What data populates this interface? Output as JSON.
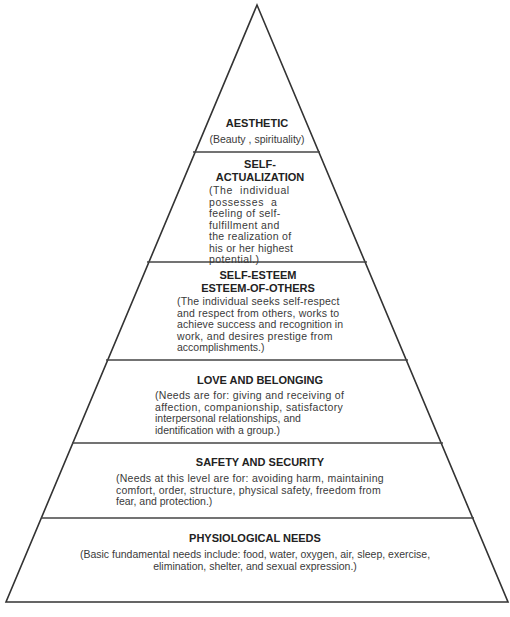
{
  "diagram": {
    "type": "pyramid",
    "levels": [
      {
        "title": "AESTHETIC",
        "description": "(Beauty , spirituality)"
      },
      {
        "title_line1": "SELF-",
        "title_line2": "ACTUALIZATION",
        "desc_lines": [
          "(The  individual",
          "possesses  a",
          "feeling of self-",
          "fulfillment and",
          "the realization of",
          "his or her highest",
          "potential.)"
        ]
      },
      {
        "title_line1": "SELF-ESTEEM",
        "title_line2": "ESTEEM-OF-OTHERS",
        "desc_lines": [
          "(The individual seeks self-respect",
          "and respect from others, works to",
          "achieve success and recognition in",
          "work, and desires prestige from",
          "accomplishments.)"
        ]
      },
      {
        "title": "LOVE AND BELONGING",
        "desc_lines": [
          "(Needs are for: giving and receiving of",
          "affection, companionship, satisfactory",
          "interpersonal relationships, and",
          "identification with a group.)"
        ]
      },
      {
        "title": "SAFETY AND SECURITY",
        "desc_lines": [
          "(Needs at this level are for: avoiding harm, maintaining",
          "comfort, order, structure, physical safety, freedom from",
          "fear, and protection.)"
        ]
      },
      {
        "title": "PHYSIOLOGICAL NEEDS",
        "desc_lines": [
          "(Basic fundamental needs include: food, water, oxygen, air, sleep, exercise,",
          "elimination, shelter, and sexual expression.)"
        ]
      }
    ]
  },
  "colors": {
    "line": "#333333",
    "text": "#2a2a2a",
    "background": "#ffffff"
  }
}
